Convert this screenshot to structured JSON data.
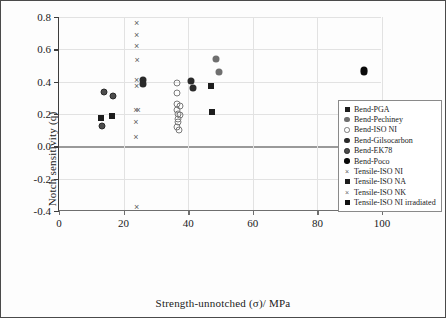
{
  "chart_data": {
    "type": "scatter",
    "title": "",
    "xlabel": "Strength-unnotched (σ)/ MPa",
    "ylabel": "Notch sensitivity (q)",
    "xlim": [
      0,
      100
    ],
    "ylim": [
      -0.4,
      0.8
    ],
    "xticks": [
      "0",
      "20",
      "40",
      "60",
      "80",
      "100"
    ],
    "xtick_values": [
      0,
      20,
      40,
      60,
      80,
      100
    ],
    "yticks": [
      "0.8",
      "0.6",
      "0.4",
      "0.2",
      "0.0",
      "-0.2",
      "-0.4"
    ],
    "ytick_values": [
      0.8,
      0.6,
      0.4,
      0.2,
      0.0,
      -0.2,
      -0.4
    ],
    "grid": true,
    "grid_axis": "both",
    "legend_position": "right",
    "colors": {
      "black": "#111111",
      "dark_grey": "#3d3d3d",
      "mid_grey": "#6f6f6f",
      "light_grey": "#9a9a9a",
      "grid": "#e2e2e2",
      "frame": "#4a4a4a",
      "background": "#ffffff"
    },
    "series": [
      {
        "name": "Bend-PGA",
        "marker": "filled-square",
        "color": "#1d1d1d",
        "points": [
          {
            "x": 13.0,
            "y": 0.175
          },
          {
            "x": 16.5,
            "y": 0.185
          },
          {
            "x": 47.5,
            "y": 0.212
          }
        ]
      },
      {
        "name": "Bend-Pechiney",
        "marker": "filled-circle-grey",
        "color": "#6f6f6f",
        "points": [
          {
            "x": 48.5,
            "y": 0.538
          },
          {
            "x": 49.5,
            "y": 0.462
          }
        ]
      },
      {
        "name": "Bend-ISO NI",
        "marker": "open-circle",
        "color": "#7a7a7a",
        "points": [
          {
            "x": 36.5,
            "y": 0.389
          },
          {
            "x": 36.5,
            "y": 0.332
          },
          {
            "x": 36.5,
            "y": 0.262
          },
          {
            "x": 37.5,
            "y": 0.252
          },
          {
            "x": 36.5,
            "y": 0.222
          },
          {
            "x": 36.8,
            "y": 0.198
          },
          {
            "x": 37.5,
            "y": 0.196
          },
          {
            "x": 36.8,
            "y": 0.17
          },
          {
            "x": 36.8,
            "y": 0.15
          },
          {
            "x": 36.6,
            "y": 0.118
          },
          {
            "x": 37.2,
            "y": 0.098
          }
        ]
      },
      {
        "name": "Bend-Gilsocarbon",
        "marker": "filled-circle-dark",
        "color": "#2a2a2a",
        "points": [
          {
            "x": 26.0,
            "y": 0.412
          },
          {
            "x": 26.0,
            "y": 0.388
          },
          {
            "x": 41.0,
            "y": 0.405
          },
          {
            "x": 41.5,
            "y": 0.358
          }
        ]
      },
      {
        "name": "Bend-EK78",
        "marker": "circle-dot",
        "color": "#4d4d4d",
        "points": [
          {
            "x": 14.0,
            "y": 0.337
          },
          {
            "x": 16.8,
            "y": 0.313
          },
          {
            "x": 13.2,
            "y": 0.124
          }
        ]
      },
      {
        "name": "Bend-Poco",
        "marker": "filled-circle-black",
        "color": "#0a0a0a",
        "points": [
          {
            "x": 94.5,
            "y": 0.473
          },
          {
            "x": 94.5,
            "y": 0.462
          }
        ]
      },
      {
        "name": "Tensile-ISO NI",
        "marker": "x-mark",
        "color": "#5e5e5e",
        "points": [
          {
            "x": 24.0,
            "y": 0.762
          },
          {
            "x": 24.0,
            "y": 0.688
          },
          {
            "x": 24.0,
            "y": 0.62
          },
          {
            "x": 24.2,
            "y": 0.532
          },
          {
            "x": 24.0,
            "y": 0.408
          },
          {
            "x": 24.0,
            "y": 0.372
          },
          {
            "x": 23.8,
            "y": 0.225
          },
          {
            "x": 24.5,
            "y": 0.225
          },
          {
            "x": 23.8,
            "y": 0.152
          },
          {
            "x": 23.8,
            "y": 0.06
          },
          {
            "x": 24.0,
            "y": -0.378
          }
        ]
      },
      {
        "name": "Tensile-ISO NA",
        "marker": "filled-square-dark",
        "color": "#1d1d1d",
        "points": [
          {
            "x": 47.0,
            "y": 0.375
          }
        ]
      },
      {
        "name": "Tensile-ISO NK",
        "marker": "x-mark-small",
        "color": "#6a6a6a",
        "points": []
      },
      {
        "name": "Tensile-ISO NI irradiated",
        "marker": "filled-square-black",
        "color": "#111111",
        "points": []
      }
    ]
  },
  "legend": {
    "items": [
      {
        "label": "Bend-PGA",
        "marker": "filled-square",
        "color": "#1d1d1d"
      },
      {
        "label": "Bend-Pechiney",
        "marker": "filled-circle-grey",
        "color": "#6f6f6f"
      },
      {
        "label": "Bend-ISO NI",
        "marker": "open-circle",
        "color": "#7a7a7a"
      },
      {
        "label": "Bend-Gilsocarbon",
        "marker": "filled-circle-dark",
        "color": "#2a2a2a"
      },
      {
        "label": "Bend-EK78",
        "marker": "circle-dot",
        "color": "#4d4d4d"
      },
      {
        "label": "Bend-Poco",
        "marker": "filled-circle-black",
        "color": "#0a0a0a"
      },
      {
        "label": "Tensile-ISO NI",
        "marker": "x-mark",
        "color": "#5e5e5e"
      },
      {
        "label": "Tensile-ISO NA",
        "marker": "filled-square-dark",
        "color": "#1d1d1d"
      },
      {
        "label": "Tensile-ISO NK",
        "marker": "x-mark-small",
        "color": "#6a6a6a"
      },
      {
        "label": "Tensile-ISO NI irradiated",
        "marker": "filled-square-black",
        "color": "#111111"
      }
    ]
  }
}
